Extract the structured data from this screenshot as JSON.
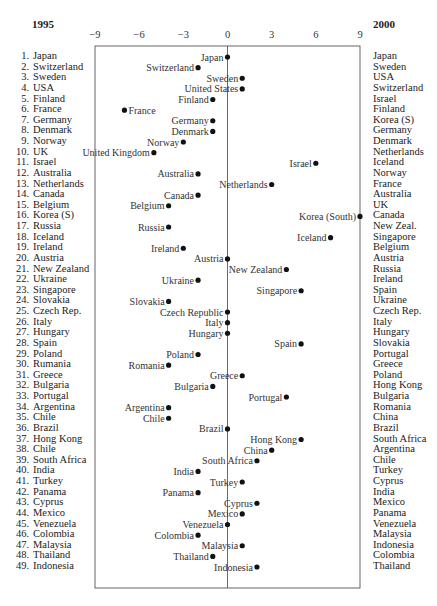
{
  "chart_data": {
    "type": "scatter",
    "title": "",
    "xlabel": "",
    "ylabel": "",
    "xlim": [
      -9,
      9
    ],
    "xticks": [
      -9,
      -6,
      -3,
      0,
      3,
      6,
      9
    ],
    "xtick_labels": [
      "−9",
      "−6",
      "−3",
      "0",
      "3",
      "6",
      "9"
    ],
    "left_header": "1995",
    "right_header": "2000",
    "ranking_1995": [
      "Japan",
      "Switzerland",
      "Sweden",
      "USA",
      "Finland",
      "France",
      "Germany",
      "Denmark",
      "Norway",
      "UK",
      "Israel",
      "Australia",
      "Netherlands",
      "Canada",
      "Belgium",
      "Korea (S)",
      "Russia",
      "Iceland",
      "Ireland",
      "Austria",
      "New Zealand",
      "Ukraine",
      "Singapore",
      "Slovakia",
      "Czech Rep.",
      "Italy",
      "Hungary",
      "Spain",
      "Poland",
      "Rumania",
      "Greece",
      "Bulgaria",
      "Portugal",
      "Argentina",
      "Chile",
      "Brazil",
      "Hong Kong",
      "Chile",
      "South Africa",
      "India",
      "Turkey",
      "Panama",
      "Cyprus",
      "Mexico",
      "Venezuela",
      "Colombia",
      "Malaysia",
      "Thailand",
      "Indonesia"
    ],
    "ranking_2000": [
      "Japan",
      "Sweden",
      "USA",
      "Switzerland",
      "Israel",
      "Finland",
      "Korea (S)",
      "Germany",
      "Denmark",
      "Netherlands",
      "Iceland",
      "Norway",
      "France",
      "Australia",
      "UK",
      "Canada",
      "New Zeal.",
      "Singapore",
      "Belgium",
      "Austria",
      "Russia",
      "Ireland",
      "Spain",
      "Ukraine",
      "Czech Rep.",
      "Italy",
      "Hungary",
      "Slovakia",
      "Portugal",
      "Greece",
      "Poland",
      "Hong Kong",
      "Bulgaria",
      "Romania",
      "China",
      "Brazil",
      "South Africa",
      "Argentina",
      "Chile",
      "Turkey",
      "Cyprus",
      "India",
      "Mexico",
      "Panama",
      "Venezuela",
      "Malaysia",
      "Indonesia",
      "Colombia",
      "Thailand"
    ],
    "points": [
      {
        "label": "Japan",
        "value": 0,
        "side": "left"
      },
      {
        "label": "Switzerland",
        "value": -2,
        "side": "left"
      },
      {
        "label": "Sweden",
        "value": 1,
        "side": "left"
      },
      {
        "label": "United States",
        "value": 1,
        "side": "left"
      },
      {
        "label": "Finland",
        "value": -1,
        "side": "left"
      },
      {
        "label": "France",
        "value": -7,
        "side": "right"
      },
      {
        "label": "Germany",
        "value": -1,
        "side": "left"
      },
      {
        "label": "Denmark",
        "value": -1,
        "side": "left"
      },
      {
        "label": "Norway",
        "value": -3,
        "side": "left"
      },
      {
        "label": "United Kingdom",
        "value": -5,
        "side": "left"
      },
      {
        "label": "Israel",
        "value": 6,
        "side": "left"
      },
      {
        "label": "Australia",
        "value": -2,
        "side": "left"
      },
      {
        "label": "Netherlands",
        "value": 3,
        "side": "left"
      },
      {
        "label": "Canada",
        "value": -2,
        "side": "left"
      },
      {
        "label": "Belgium",
        "value": -4,
        "side": "left"
      },
      {
        "label": "Korea (South)",
        "value": 9,
        "side": "left"
      },
      {
        "label": "Russia",
        "value": -4,
        "side": "left"
      },
      {
        "label": "Iceland",
        "value": 7,
        "side": "left"
      },
      {
        "label": "Ireland",
        "value": -3,
        "side": "left"
      },
      {
        "label": "Austria",
        "value": 0,
        "side": "left"
      },
      {
        "label": "New Zealand",
        "value": 4,
        "side": "left"
      },
      {
        "label": "Ukraine",
        "value": -2,
        "side": "left"
      },
      {
        "label": "Singapore",
        "value": 5,
        "side": "left"
      },
      {
        "label": "Slovakia",
        "value": -4,
        "side": "left"
      },
      {
        "label": "Czech Republic",
        "value": 0,
        "side": "left"
      },
      {
        "label": "Italy",
        "value": 0,
        "side": "left"
      },
      {
        "label": "Hungary",
        "value": 0,
        "side": "left"
      },
      {
        "label": "Spain",
        "value": 5,
        "side": "left"
      },
      {
        "label": "Poland",
        "value": -2,
        "side": "left"
      },
      {
        "label": "Romania",
        "value": -4,
        "side": "left"
      },
      {
        "label": "Greece",
        "value": 1,
        "side": "left"
      },
      {
        "label": "Bulgaria",
        "value": -1,
        "side": "left"
      },
      {
        "label": "Portugal",
        "value": 4,
        "side": "left"
      },
      {
        "label": "Argentina",
        "value": -4,
        "side": "left"
      },
      {
        "label": "Chile",
        "value": -4,
        "side": "left"
      },
      {
        "label": "Brazil",
        "value": 0,
        "side": "left"
      },
      {
        "label": "Hong Kong",
        "value": 5,
        "side": "left"
      },
      {
        "label": "China",
        "value": 3,
        "side": "left"
      },
      {
        "label": "South Africa",
        "value": 2,
        "side": "left"
      },
      {
        "label": "India",
        "value": -2,
        "side": "left"
      },
      {
        "label": "Turkey",
        "value": 1,
        "side": "left"
      },
      {
        "label": "Panama",
        "value": -2,
        "side": "left"
      },
      {
        "label": "Cyprus",
        "value": 2,
        "side": "left"
      },
      {
        "label": "Mexico",
        "value": 1,
        "side": "left"
      },
      {
        "label": "Venezuela",
        "value": 0,
        "side": "left"
      },
      {
        "label": "Colombia",
        "value": -2,
        "side": "left"
      },
      {
        "label": "Malaysia",
        "value": 1,
        "side": "left"
      },
      {
        "label": "Thailand",
        "value": -1,
        "side": "left"
      },
      {
        "label": "Indonesia",
        "value": 2,
        "side": "left"
      }
    ],
    "grid": false,
    "zero_line": true
  }
}
